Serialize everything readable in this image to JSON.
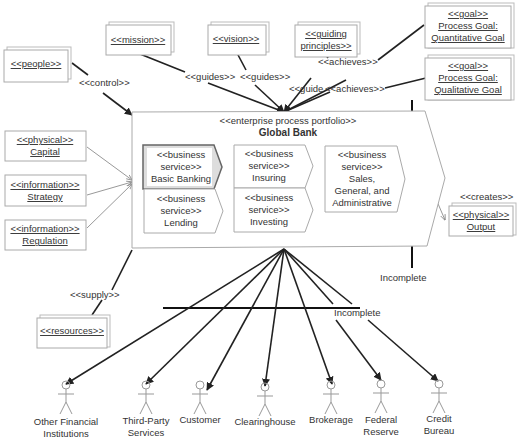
{
  "diagram": {
    "portfolio": {
      "stereotype": "<<enterprise process portfolio>>",
      "title": "Global Bank",
      "services": [
        {
          "stereotype_1": "<<business",
          "stereotype_2": "service>>",
          "name": "Basic Banking",
          "highlighted": true
        },
        {
          "stereotype_1": "<<business",
          "stereotype_2": "service>>",
          "name": "Lending"
        },
        {
          "stereotype_1": "<<business",
          "stereotype_2": "service>>",
          "name": "Insuring"
        },
        {
          "stereotype_1": "<<business",
          "stereotype_2": "service>>",
          "name": "Investing"
        },
        {
          "stereotype_1": "<<business",
          "stereotype_2": "service>>",
          "name_1": "Sales,",
          "name_2": "General, and",
          "name_3": "Administrative"
        }
      ]
    },
    "top_objects": {
      "people": "<<people>>",
      "mission": "<<mission>>",
      "vision": "<<vision>>",
      "guiding_1": "<<guiding",
      "guiding_2": "principles>>",
      "goal_quant": {
        "stereotype": "<<goal>>",
        "line1": "Process Goal:",
        "line2": "Quantitative Goal"
      },
      "goal_qual": {
        "stereotype": "<<goal>>",
        "line1": "Process Goal:",
        "line2": "Qualitative Goal"
      }
    },
    "left_objects": {
      "capital": {
        "stereotype": "<<physical>>",
        "name": "Capital"
      },
      "strategy": {
        "stereotype": "<<information>>",
        "name": "Strategy"
      },
      "regulation": {
        "stereotype": "<<information>>",
        "name": "Regulation"
      },
      "resources": "<<resources>>"
    },
    "output": {
      "stereotype": "<<physical>>",
      "name": "Output"
    },
    "relations": {
      "control": "<<control>>",
      "guides_1": "<<guides>>",
      "guides_2": "<<guides>>",
      "guide": "<<guide",
      "achieves_1": "<<achieves>>",
      "achieves_2": "<<achieves>>",
      "creates": "<<creates>>",
      "supply": "<<supply>>",
      "incomplete_1": "Incomplete",
      "incomplete_2": "Incomplete"
    },
    "actors": [
      {
        "line1": "Other Financial",
        "line2": "Institutions"
      },
      {
        "line1": "Third-Party",
        "line2": "Services"
      },
      {
        "line1": "Customer",
        "line2": ""
      },
      {
        "line1": "Clearinghouse",
        "line2": ""
      },
      {
        "line1": "Brokerage",
        "line2": ""
      },
      {
        "line1": "Federal",
        "line2": "Reserve"
      },
      {
        "line1": "Credit",
        "line2": "Bureau"
      }
    ]
  }
}
